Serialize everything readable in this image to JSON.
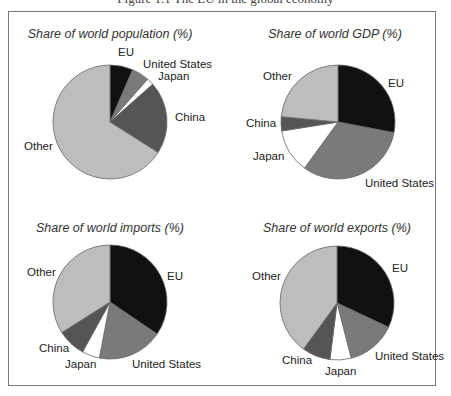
{
  "caption": "Figure 1.1 The EU in the global economy",
  "colors": {
    "EU": "#111111",
    "United States": "#7a7a7a",
    "Japan": "#ffffff",
    "China": "#555555",
    "Other": "#bdbdbd",
    "outline": "#666666"
  },
  "chart_data": [
    {
      "type": "pie",
      "title": "Share of world population (%)",
      "categories": [
        "EU",
        "United States",
        "Japan",
        "China",
        "Other"
      ],
      "values": [
        6.5,
        5,
        2,
        20.5,
        66
      ],
      "center": [
        110,
        122
      ],
      "radius": 57,
      "labels": [
        {
          "text": "EU",
          "x": 118,
          "y": 56
        },
        {
          "text": "United States",
          "x": 143,
          "y": 68
        },
        {
          "text": "Japan",
          "x": 158,
          "y": 80
        },
        {
          "text": "China",
          "x": 175,
          "y": 121
        },
        {
          "text": "Other",
          "x": 24,
          "y": 150
        }
      ]
    },
    {
      "type": "pie",
      "title": "Share of world GDP (%)",
      "categories": [
        "EU",
        "United States",
        "Japan",
        "China",
        "Other"
      ],
      "values": [
        28,
        32,
        12.5,
        4,
        23.5
      ],
      "center": [
        338,
        122
      ],
      "radius": 57,
      "labels": [
        {
          "text": "EU",
          "x": 388,
          "y": 87
        },
        {
          "text": "United States",
          "x": 365,
          "y": 187
        },
        {
          "text": "Japan",
          "x": 253,
          "y": 160
        },
        {
          "text": "China",
          "x": 246,
          "y": 127
        },
        {
          "text": "Other",
          "x": 263,
          "y": 80
        }
      ]
    },
    {
      "type": "pie",
      "title": "Share of world imports (%)",
      "categories": [
        "EU",
        "United States",
        "Japan",
        "China",
        "Other"
      ],
      "values": [
        34.5,
        18.5,
        5,
        8,
        34
      ],
      "center": [
        110,
        302
      ],
      "radius": 57,
      "labels": [
        {
          "text": "EU",
          "x": 167,
          "y": 280
        },
        {
          "text": "United States",
          "x": 132,
          "y": 368
        },
        {
          "text": "Japan",
          "x": 65,
          "y": 368
        },
        {
          "text": "China",
          "x": 39,
          "y": 352
        },
        {
          "text": "Other",
          "x": 27,
          "y": 276
        }
      ]
    },
    {
      "type": "pie",
      "title": "Share of world exports (%)",
      "categories": [
        "EU",
        "United States",
        "Japan",
        "China",
        "Other"
      ],
      "values": [
        32,
        14,
        6,
        8,
        40
      ],
      "center": [
        337,
        303
      ],
      "radius": 57,
      "labels": [
        {
          "text": "EU",
          "x": 392,
          "y": 272
        },
        {
          "text": "United States",
          "x": 375,
          "y": 360
        },
        {
          "text": "Japan",
          "x": 325,
          "y": 375
        },
        {
          "text": "China",
          "x": 282,
          "y": 364
        },
        {
          "text": "Other",
          "x": 252,
          "y": 280
        }
      ]
    }
  ]
}
